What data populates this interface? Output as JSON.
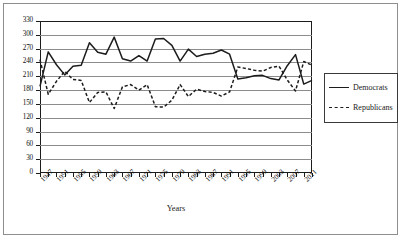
{
  "chart_data": {
    "type": "line",
    "title": "",
    "xlabel": "Years",
    "ylabel": "Number of Representatives",
    "ylim": [
      0,
      330
    ],
    "ytick_step": 30,
    "yticks": [
      0,
      30,
      60,
      90,
      120,
      150,
      180,
      210,
      240,
      270,
      300,
      330
    ],
    "grid": true,
    "legend_position": "right",
    "x": [
      1947,
      1949,
      1951,
      1953,
      1955,
      1957,
      1959,
      1961,
      1963,
      1965,
      1967,
      1969,
      1971,
      1973,
      1975,
      1977,
      1979,
      1981,
      1983,
      1985,
      1987,
      1989,
      1991,
      1993,
      1995,
      1997,
      1999,
      2001,
      2003,
      2005,
      2007,
      2009,
      2011,
      2013
    ],
    "xtick_labels": [
      "1947",
      "1951",
      "1955",
      "1959",
      "1963",
      "1967",
      "1971",
      "1975",
      "1979",
      "1983",
      "1987",
      "1991",
      "1995",
      "1999",
      "2003",
      "2007",
      "2011"
    ],
    "xtick_label_step_years": 4,
    "xtick_mark_step_years": 2,
    "series": [
      {
        "name": "Democrats",
        "style": "solid",
        "color": "#1c1c1c",
        "values": [
          188,
          263,
          235,
          213,
          232,
          234,
          283,
          262,
          258,
          295,
          248,
          243,
          255,
          243,
          291,
          292,
          277,
          243,
          269,
          253,
          258,
          260,
          267,
          258,
          204,
          207,
          211,
          212,
          205,
          202,
          233,
          257,
          193,
          201
        ]
      },
      {
        "name": "Republicans",
        "style": "dashed",
        "color": "#1c1c1c",
        "values": [
          246,
          171,
          199,
          221,
          203,
          201,
          153,
          175,
          176,
          140,
          187,
          192,
          180,
          192,
          144,
          143,
          158,
          192,
          166,
          182,
          177,
          175,
          167,
          176,
          230,
          227,
          223,
          221,
          229,
          232,
          202,
          178,
          242,
          234
        ]
      }
    ]
  },
  "legend": {
    "entries": [
      {
        "label": "Democrats",
        "swatch": "solid-line-swatch"
      },
      {
        "label": "Republicans",
        "swatch": "dashed-line-swatch"
      }
    ]
  }
}
